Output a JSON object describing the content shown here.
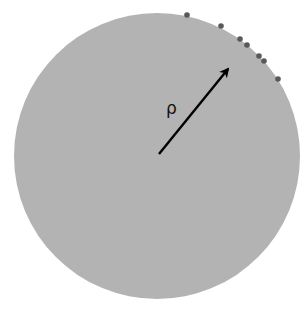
{
  "diagram": {
    "type": "disk-with-radius",
    "disk": {
      "cx": 157,
      "cy": 156,
      "r": 143,
      "fill": "#b3b3b3"
    },
    "radius_arrow": {
      "x1": 159,
      "y1": 154,
      "x2": 228,
      "y2": 69,
      "color": "#000000"
    },
    "radius_label": {
      "text": "ρ",
      "x": 166,
      "y": 114
    },
    "boundary_points": {
      "color": "#595959",
      "points": [
        {
          "x": 187,
          "y": 15
        },
        {
          "x": 221,
          "y": 26
        },
        {
          "x": 240,
          "y": 39
        },
        {
          "x": 247,
          "y": 45
        },
        {
          "x": 259,
          "y": 56
        },
        {
          "x": 264,
          "y": 61
        },
        {
          "x": 278,
          "y": 79
        }
      ]
    }
  }
}
